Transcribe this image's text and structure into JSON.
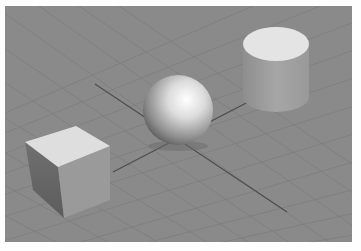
{
  "viewport": {
    "name": "3D perspective viewport",
    "background_color": "#8a8a8a",
    "grid_color": "#7d7d7d",
    "axis_color": "#4a4a4a"
  },
  "scene": {
    "objects": [
      {
        "type": "box",
        "label": "Cube",
        "color": "#b8b8b8"
      },
      {
        "type": "sphere",
        "label": "Sphere",
        "color": "#d8d8d8"
      },
      {
        "type": "cylinder",
        "label": "Cylinder",
        "color": "#a8a8a8"
      }
    ]
  }
}
